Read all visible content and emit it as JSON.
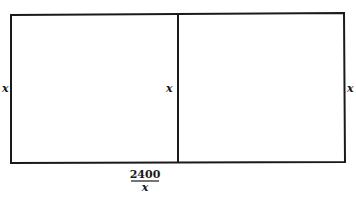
{
  "diagram": {
    "labels": {
      "left_side": "x",
      "middle_divider": "x",
      "right_side": "x",
      "bottom_numerator": "2400",
      "bottom_denominator": "x"
    },
    "colors": {
      "stroke": "#1a1a1a",
      "background": "#ffffff"
    }
  }
}
